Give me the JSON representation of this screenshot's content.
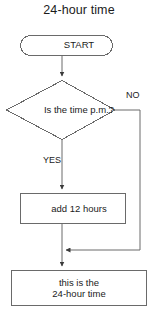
{
  "diagram": {
    "title": "24-hour time",
    "type": "flowchart",
    "orientation": "vertical",
    "background_color": "#ffffff",
    "line_color": "#4d4d4d",
    "text_color": "#1b1b1b",
    "nodes": [
      {
        "id": "start",
        "shape": "terminator",
        "label": "START"
      },
      {
        "id": "decision",
        "shape": "diamond",
        "label": "Is the time p.m.?"
      },
      {
        "id": "process",
        "shape": "rectangle",
        "label": "add 12 hours"
      },
      {
        "id": "end",
        "shape": "rectangle",
        "label_line1": "this is the",
        "label_line2": "24-hour time"
      }
    ],
    "edges": [
      {
        "from": "start",
        "to": "decision",
        "label": ""
      },
      {
        "from": "decision",
        "to": "process",
        "label": "YES"
      },
      {
        "from": "decision",
        "to": "end",
        "label": "NO"
      },
      {
        "from": "process",
        "to": "end",
        "label": ""
      }
    ],
    "branch_labels": {
      "yes": "YES",
      "no": "NO"
    }
  }
}
